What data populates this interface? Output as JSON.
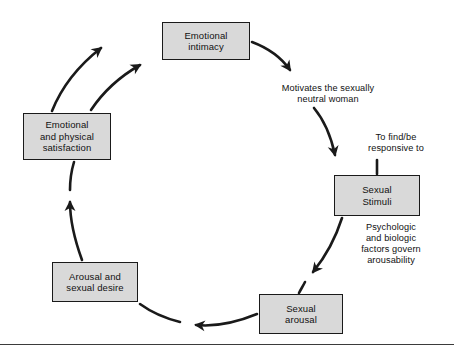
{
  "figure": {
    "type": "cycle-diagram",
    "background_color": "#ffffff",
    "node_fill_color": "#d9d9d9",
    "node_border_color": "#1a1a1a",
    "arrow_color": "#1a1a1a",
    "text_color": "#111111",
    "rule_color": "#3b3b3b"
  },
  "nodes": [
    {
      "id": "emotional-intimacy",
      "label": "Emotional\nintimacy",
      "x": 162,
      "y": 22,
      "width": 88,
      "height": 38
    },
    {
      "id": "sexual-stimuli",
      "label": "Sexual\nStimuli",
      "x": 334,
      "y": 175,
      "width": 86,
      "height": 41
    },
    {
      "id": "sexual-arousal",
      "label": "Sexual\narousal",
      "x": 259,
      "y": 294,
      "width": 84,
      "height": 40
    },
    {
      "id": "arousal-and-sexual-desire",
      "label": "Arousal and\nsexual desire",
      "x": 52,
      "y": 262,
      "width": 86,
      "height": 40
    },
    {
      "id": "emotional-and-physical-satisfaction",
      "label": "Emotional\nand physical\nsatisfaction",
      "x": 23,
      "y": 113,
      "width": 88,
      "height": 47
    }
  ],
  "edge_labels": [
    {
      "id": "motivates-the-sexually-neutral-woman",
      "text": "Motivates the sexually\nneutral woman",
      "x": 258,
      "y": 83,
      "width": 140
    },
    {
      "id": "to-find-be-responsive-to",
      "text": "To find/be\nresponsive to",
      "x": 348,
      "y": 132,
      "width": 96
    },
    {
      "id": "psychologic-and-biologic-factors-govern-arousability",
      "text": "Psychologic\nand biologic\nfactors govern\narousability",
      "x": 341,
      "y": 222,
      "width": 100
    }
  ],
  "bottom_rule": {
    "y": 344
  }
}
